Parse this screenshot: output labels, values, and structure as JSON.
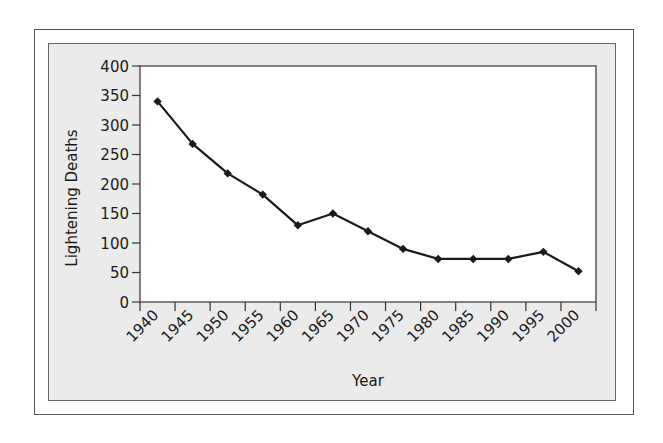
{
  "chart_data": {
    "type": "line",
    "title": "",
    "xlabel": "Year",
    "ylabel": "Lightening Deaths",
    "categories": [
      "1940",
      "1945",
      "1950",
      "1955",
      "1960",
      "1965",
      "1970",
      "1975",
      "1980",
      "1985",
      "1990",
      "1995",
      "2000"
    ],
    "series": [
      {
        "name": "Lightening Deaths",
        "values": [
          340,
          268,
          218,
          182,
          130,
          150,
          120,
          90,
          73,
          73,
          73,
          85,
          52
        ],
        "marker": "diamond",
        "color": "#1a1a1a"
      }
    ],
    "ylim": [
      0,
      400
    ],
    "yticks": [
      0,
      50,
      100,
      150,
      200,
      250,
      300,
      350,
      400
    ],
    "ytick_labels": [
      "0",
      "50",
      "100",
      "150",
      "200",
      "250",
      "300",
      "350",
      "400"
    ],
    "xtick_rotation": -45,
    "grid": false,
    "legend": "none"
  },
  "colors": {
    "panel_background": "#ebebeb",
    "plot_background": "#ffffff",
    "line": "#1a1a1a",
    "frame": "#555555"
  }
}
